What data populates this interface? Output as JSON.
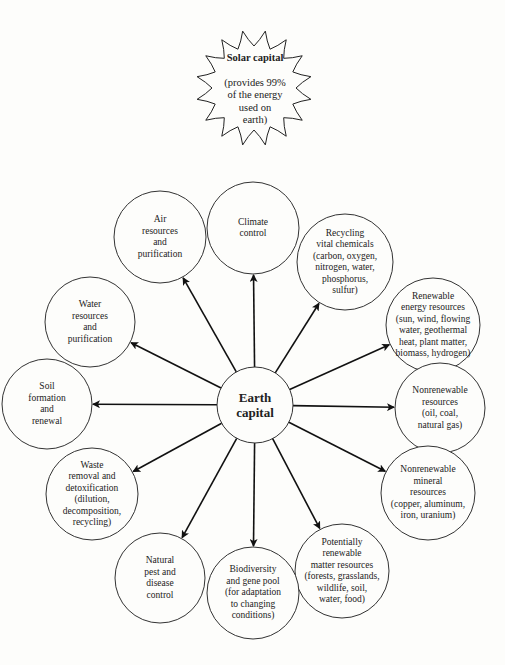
{
  "sun": {
    "title": "Solar capital",
    "subtitle": "(provides 99%\nof the energy\nused on\nearth)"
  },
  "center": {
    "label": "Earth\ncapital"
  },
  "nodes": [
    {
      "id": "climate",
      "label": "Climate\ncontrol"
    },
    {
      "id": "recycling",
      "label": "Recycling\nvital chemicals\n(carbon, oxygen,\nnitrogen, water,\nphosphorus,\nsulfur)"
    },
    {
      "id": "renewable-energy",
      "label": "Renewable\nenergy resources\n(sun, wind, flowing\nwater, geothermal\nheat, plant matter,\nbiomass, hydrogen)"
    },
    {
      "id": "nonrenewable",
      "label": "Nonrenewable\nresources\n(oil, coal,\nnatural gas)"
    },
    {
      "id": "nonrenewable-mineral",
      "label": "Nonrenewable\nmineral\nresources\n(copper, aluminum,\niron, uranium)"
    },
    {
      "id": "potentially-renewable",
      "label": "Potentially\nrenewable\nmatter resources\n(forests, grasslands,\nwildlife, soil,\nwater, food)"
    },
    {
      "id": "biodiversity",
      "label": "Biodiversity\nand gene pool\n(for adaptation\nto changing\nconditions)"
    },
    {
      "id": "pest-control",
      "label": "Natural\npest and\ndisease\ncontrol"
    },
    {
      "id": "waste",
      "label": "Waste\nremoval and\ndetoxification\n(dilution,\ndecomposition,\nrecycling)"
    },
    {
      "id": "soil",
      "label": "Soil\nformation\nand\nrenewal"
    },
    {
      "id": "water",
      "label": "Water\nresources\nand\npurification"
    },
    {
      "id": "air",
      "label": "Air\nresources\nand\npurification"
    }
  ]
}
